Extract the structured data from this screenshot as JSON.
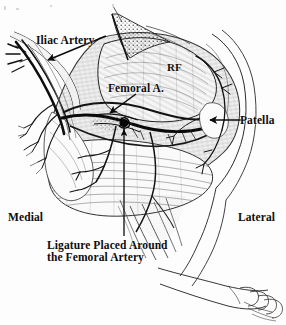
{
  "figure": {
    "kind": "anatomical-illustration",
    "style": "black-and-white engraved line drawing, scanned",
    "width": 286,
    "height": 325,
    "background_color": "#fdfdfd",
    "ink_color": "#111111"
  },
  "labels": {
    "iliac_artery": "Iliac Artery",
    "femoral_artery": "Femoral A.",
    "rectus_femoris": "RF",
    "patella": "Patella",
    "medial": "Medial",
    "lateral": "Lateral",
    "ligature_line1": "Ligature Placed Around",
    "ligature_line2": "the Femoral Artery"
  },
  "leaders": [
    {
      "name": "iliac-artery-arrow",
      "from": [
        104,
        36
      ],
      "to": [
        46,
        60
      ],
      "direction": "down-left"
    },
    {
      "name": "femoral-artery-arrow",
      "from": [
        133,
        94
      ],
      "to": [
        108,
        112
      ],
      "direction": "down-left"
    },
    {
      "name": "patella-arrow",
      "from": [
        243,
        120
      ],
      "to": [
        208,
        120
      ],
      "direction": "left"
    },
    {
      "name": "ligature-arrow",
      "from": [
        124,
        238
      ],
      "to": [
        124,
        128
      ],
      "direction": "up"
    }
  ],
  "structures": [
    {
      "name": "thigh-muscle-mass",
      "description": "large rounded anterior thigh musculature with fiber hatching"
    },
    {
      "name": "rectus-femoris-muscle",
      "description": "retracted muscle belly marked RF"
    },
    {
      "name": "femoral-artery-trunk",
      "description": "dark vessel running transversely across mid-thigh"
    },
    {
      "name": "iliac-vessel-bundle",
      "description": "proximal vessel bundle with branches at upper left"
    },
    {
      "name": "ligature-knot",
      "description": "dark knot tied around the femoral artery at mid-thigh"
    },
    {
      "name": "patella-region",
      "description": "knee and kneecap contour at right"
    },
    {
      "name": "vascular-branches",
      "description": "fine arterial branching over knee and thigh"
    },
    {
      "name": "examiner-hand",
      "description": "outlined hand and forearm at lower right"
    },
    {
      "name": "skin-flap",
      "description": "retracted incision flap at top center"
    }
  ]
}
